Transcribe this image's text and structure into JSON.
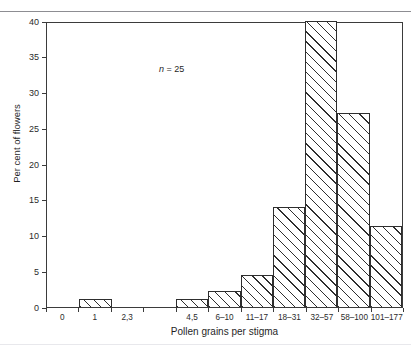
{
  "page": {
    "top_remnant": "",
    "bottom_remnant": ""
  },
  "annotation": {
    "symbol": "n",
    "text": " = 25"
  },
  "axis": {
    "y_title": "Per cent of flowers",
    "x_title": "Pollen grains per stigma",
    "y_ticks": [
      "0",
      "5",
      "10",
      "15",
      "20",
      "25",
      "30",
      "35",
      "40"
    ]
  },
  "chart_data": {
    "type": "bar",
    "title": "",
    "subtitle": "",
    "xlabel": "Pollen grains per stigma",
    "ylabel": "Per cent of flowers",
    "ylim": [
      0,
      40
    ],
    "ytick_interval": 5,
    "grid": false,
    "legend": null,
    "annotations": [
      "n = 25"
    ],
    "bar_style": "diagonal-hatch",
    "categories": [
      "0",
      "1",
      "2,3",
      "4,5",
      "6–10",
      "11–17",
      "18–31",
      "32–57",
      "58–100",
      "101–177"
    ],
    "tick_labels": [
      "0",
      "1",
      "2,3",
      "4,5",
      "6–10",
      "11–17",
      "18–31",
      "32–57",
      "58–100",
      "101–177"
    ],
    "values": [
      0,
      1.1,
      0,
      1.1,
      2.2,
      4.5,
      14.0,
      40.0,
      27.1,
      11.3
    ],
    "bins": [
      {
        "label": "0",
        "value": 0
      },
      {
        "label": "1",
        "value": 1.1
      },
      {
        "label": "2,3",
        "value": 0
      },
      {
        "label": "",
        "value": 0
      },
      {
        "label": "4,5",
        "value": 1.1
      },
      {
        "label": "6–10",
        "value": 2.2
      },
      {
        "label": "11–17",
        "value": 4.5
      },
      {
        "label": "18–31",
        "value": 14.0
      },
      {
        "label": "32–57",
        "value": 40.0
      },
      {
        "label": "58–100",
        "value": 27.1
      },
      {
        "label": "101–177",
        "value": 11.3
      }
    ]
  }
}
